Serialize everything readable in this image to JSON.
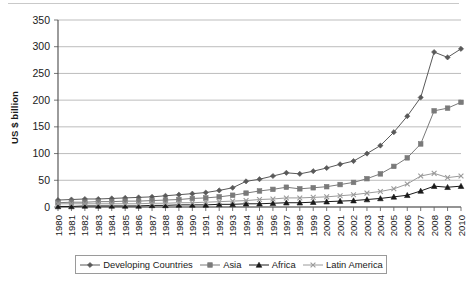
{
  "chart_data": {
    "type": "line",
    "title": "",
    "subtitle": "",
    "xlabel": "",
    "ylabel": "US $ billion",
    "ylim": [
      0,
      350
    ],
    "ytick_step": 50,
    "yticks": [
      "0",
      "50",
      "100",
      "150",
      "200",
      "250",
      "300",
      "350"
    ],
    "grid": true,
    "legend_position": "bottom",
    "categories": [
      "1980",
      "1981",
      "1982",
      "1983",
      "1984",
      "1985",
      "1986",
      "1987",
      "1988",
      "1989",
      "1990",
      "1991",
      "1992",
      "1993",
      "1994",
      "1995",
      "1996",
      "1997",
      "1998",
      "1999",
      "2000",
      "2001",
      "2002",
      "2003",
      "2004",
      "2005",
      "2006",
      "2007",
      "2008",
      "2009",
      "2010"
    ],
    "series": [
      {
        "name": "Developing Countries",
        "marker": "diamond",
        "color": "#595959",
        "values": [
          13,
          14,
          15,
          15,
          16,
          17,
          18,
          19,
          21,
          23,
          25,
          27,
          31,
          36,
          48,
          52,
          58,
          64,
          62,
          67,
          73,
          80,
          86,
          100,
          115,
          140,
          170,
          205,
          290,
          280,
          296
        ]
      },
      {
        "name": "Asia",
        "marker": "square",
        "color": "#7a7a7a",
        "values": [
          8,
          9,
          9,
          10,
          10,
          11,
          11,
          12,
          13,
          14,
          16,
          17,
          19,
          22,
          26,
          30,
          33,
          37,
          34,
          36,
          38,
          42,
          46,
          53,
          62,
          76,
          92,
          118,
          180,
          185,
          196
        ]
      },
      {
        "name": "Africa",
        "marker": "triangle",
        "color": "#1a1a1a",
        "values": [
          1,
          1,
          2,
          2,
          2,
          2,
          2,
          3,
          3,
          4,
          4,
          4,
          5,
          5,
          6,
          6,
          7,
          8,
          8,
          9,
          10,
          11,
          12,
          14,
          16,
          19,
          22,
          30,
          39,
          37,
          39
        ]
      },
      {
        "name": "Latin America",
        "marker": "x",
        "color": "#9a9a9a",
        "values": [
          6,
          6,
          6,
          6,
          6,
          6,
          6,
          7,
          7,
          8,
          8,
          9,
          10,
          11,
          12,
          14,
          15,
          17,
          17,
          18,
          19,
          21,
          23,
          26,
          29,
          34,
          43,
          58,
          63,
          55,
          58
        ]
      }
    ]
  }
}
